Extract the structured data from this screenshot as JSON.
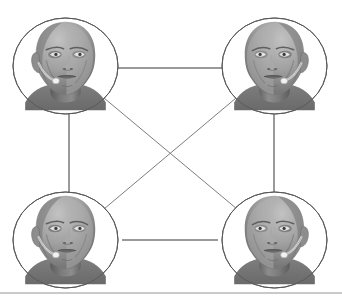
{
  "figure": {
    "background_color": "#ffffff",
    "width": 342,
    "height": 303
  },
  "style": {
    "node_stroke_color": "#5a5a5a",
    "node_fill_color": "#ffffff",
    "edge_color": "#9a9a9a",
    "diagonal_edge_color": "#7d7d7d",
    "footer_rule_color": "#c9c9c9",
    "node_stroke_width": 1,
    "edge_stroke_width": 2,
    "diagonal_stroke_width": 1
  },
  "nodes": [
    {
      "id": "node-top-left",
      "label": "Participant with headset, top left",
      "icon": "head-with-headset-icon",
      "cx": 65.5,
      "cy": 66,
      "rx": 52.5,
      "ry": 48,
      "facing": "right",
      "mic_side": "right"
    },
    {
      "id": "node-top-right",
      "label": "Participant with headset, top right",
      "icon": "head-with-headset-icon",
      "cx": 274.5,
      "cy": 66,
      "rx": 52.5,
      "ry": 48,
      "facing": "left",
      "mic_side": "left"
    },
    {
      "id": "node-bottom-left",
      "label": "Participant with headset, bottom left",
      "icon": "head-with-headset-icon",
      "cx": 65.5,
      "cy": 240,
      "rx": 52.5,
      "ry": 48,
      "facing": "right",
      "mic_side": "right"
    },
    {
      "id": "node-bottom-right",
      "label": "Participant with headset, bottom right",
      "icon": "head-with-headset-icon",
      "cx": 274.5,
      "cy": 240,
      "rx": 52.5,
      "ry": 48,
      "facing": "left",
      "mic_side": "left"
    }
  ],
  "edges": [
    {
      "id": "edge-top",
      "label": "top-left to top-right",
      "from": "node-top-left",
      "to": "node-top-right",
      "kind": "horizontal",
      "x1": 118,
      "y1": 68,
      "x2": 222,
      "y2": 68
    },
    {
      "id": "edge-left",
      "label": "top-left to bottom-left",
      "from": "node-top-left",
      "to": "node-bottom-left",
      "kind": "vertical",
      "x1": 69,
      "y1": 113,
      "x2": 69,
      "y2": 193
    },
    {
      "id": "edge-right",
      "label": "top-right to bottom-right",
      "from": "node-top-right",
      "to": "node-bottom-right",
      "kind": "vertical",
      "x1": 274,
      "y1": 113,
      "x2": 274,
      "y2": 193
    },
    {
      "id": "edge-bottom",
      "label": "bottom-left to bottom-right",
      "from": "node-bottom-left",
      "to": "node-bottom-right",
      "kind": "horizontal",
      "x1": 122,
      "y1": 240,
      "x2": 218,
      "y2": 240
    },
    {
      "id": "edge-diagonal-tl-br",
      "label": "top-left to bottom-right",
      "from": "node-top-left",
      "to": "node-bottom-right",
      "kind": "diagonal",
      "x1": 104,
      "y1": 98,
      "x2": 237,
      "y2": 209
    },
    {
      "id": "edge-diagonal-tr-bl",
      "label": "top-right to bottom-left",
      "from": "node-top-right",
      "to": "node-bottom-left",
      "kind": "diagonal",
      "x1": 236,
      "y1": 98,
      "x2": 104,
      "y2": 209
    }
  ],
  "crossing_point": {
    "x": 171,
    "y": 154
  },
  "footer": {
    "rule_y": 292,
    "visible": true
  }
}
